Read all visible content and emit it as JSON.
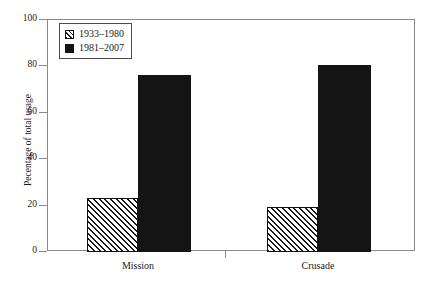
{
  "chart_data": {
    "type": "bar",
    "title": "",
    "subtitle": "",
    "xlabel": "",
    "ylabel": "Pecentage of total usage",
    "categories": [
      "Mission",
      "Crusade"
    ],
    "series": [
      {
        "name": "1933–1980",
        "values": [
          23.5,
          19.5
        ],
        "fill": "hatch-diagonal",
        "color": "#1a1a1a"
      },
      {
        "name": "1981–2007",
        "values": [
          76.5,
          80.5
        ],
        "fill": "solid",
        "color": "#141414"
      }
    ],
    "ylim": [
      0,
      100
    ],
    "yticks": [
      0,
      20,
      40,
      60,
      80,
      100
    ],
    "ytick_labels": [
      "0",
      "20",
      "40",
      "60",
      "80",
      "100"
    ],
    "grid": false,
    "legend_position": "upper left",
    "frame_color": "#8a8a8a"
  },
  "legend": {
    "entries": [
      {
        "label": "1933–1980",
        "swatch": "hatch-swatch-icon"
      },
      {
        "label": "1981–2007",
        "swatch": "solid-swatch-icon"
      }
    ]
  },
  "axes": {
    "y_title": "Pecentage of total usage",
    "y_ticks": [
      {
        "label": "100",
        "value": 100
      },
      {
        "label": "80",
        "value": 80
      },
      {
        "label": "60",
        "value": 60
      },
      {
        "label": "40",
        "value": 40
      },
      {
        "label": "20",
        "value": 20
      },
      {
        "label": "0",
        "value": 0
      }
    ],
    "x_ticks": [
      {
        "label": "Mission"
      },
      {
        "label": "Crusade"
      }
    ]
  }
}
